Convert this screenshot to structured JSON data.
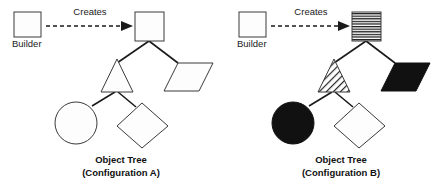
{
  "figure": {
    "background_color": "#ffffff",
    "stroke_color": "#1a1a1a",
    "fill_white": "#fdfdfd",
    "fill_black": "#111111"
  },
  "panels": [
    {
      "id": "configuration-a",
      "builder_label": "Builder",
      "creates_label": "Creates",
      "caption_line1": "Object Tree",
      "caption_line2": "(Configuration A)",
      "nodes": [
        {
          "name": "root-square",
          "shape": "square",
          "fill": "white"
        },
        {
          "name": "triangle",
          "shape": "triangle",
          "fill": "white"
        },
        {
          "name": "parallelogram",
          "shape": "parallelogram",
          "fill": "white"
        },
        {
          "name": "circle",
          "shape": "circle",
          "fill": "white"
        },
        {
          "name": "diamond",
          "shape": "diamond",
          "fill": "white"
        }
      ]
    },
    {
      "id": "configuration-b",
      "builder_label": "Builder",
      "creates_label": "Creates",
      "caption_line1": "Object Tree",
      "caption_line2": "(Configuration B)",
      "nodes": [
        {
          "name": "root-square",
          "shape": "square",
          "fill": "horizontal-hatch"
        },
        {
          "name": "triangle",
          "shape": "triangle",
          "fill": "diagonal-hatch"
        },
        {
          "name": "parallelogram",
          "shape": "parallelogram",
          "fill": "black"
        },
        {
          "name": "circle",
          "shape": "circle",
          "fill": "black"
        },
        {
          "name": "diamond",
          "shape": "diamond",
          "fill": "white"
        }
      ]
    }
  ]
}
